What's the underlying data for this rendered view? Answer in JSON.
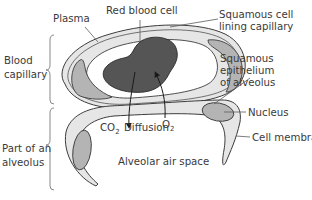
{
  "diagram": {
    "type": "biology-diagram",
    "labels": {
      "plasma": "Plasma",
      "red_blood_cell": "Red blood cell",
      "squamous_cell_line1": "Squamous cell",
      "squamous_cell_line2": "lining capillary",
      "blood_line1": "Blood",
      "blood_line2": "capillary",
      "squamous_epi_line1": "Squamous",
      "squamous_epi_line2": "epithelium",
      "squamous_epi_line3": "of alveolus",
      "nucleus": "Nucleus",
      "cell_membrane": "Cell membrane",
      "part_line1": "Part of an",
      "part_line2": "alveolus",
      "co2_main": "CO",
      "co2_sub": "2",
      "o2_main": "O",
      "o2_sub": "2",
      "diffusion": "Diffusion",
      "alveolar_air_space": "Alveolar air space"
    },
    "colors": {
      "cell_fill": "#e8e8e8",
      "nucleus_fill": "#b4b4b4",
      "rbc_fill": "#555555",
      "outline": "#3c3c3c",
      "text": "#3a3a3a"
    }
  }
}
